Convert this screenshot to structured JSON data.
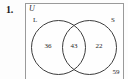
{
  "exercise": {
    "number": "1."
  },
  "diagram": {
    "type": "venn",
    "universe_label": "U",
    "sets": [
      {
        "key": "left",
        "label": "L"
      },
      {
        "key": "right",
        "label": "S"
      }
    ],
    "regions": [
      {
        "key": "left_only",
        "label": "L only",
        "value": "36"
      },
      {
        "key": "intersection",
        "label": "L and S",
        "value": "43"
      },
      {
        "key": "right_only",
        "label": "S only",
        "value": "22"
      },
      {
        "key": "outside",
        "label": "neither",
        "value": "59"
      }
    ],
    "colors": {
      "box_border": "#9a9a9a",
      "circle_stroke": "#3c3c3c",
      "text": "#1e1e1e",
      "background": "#fdfdfd"
    }
  }
}
